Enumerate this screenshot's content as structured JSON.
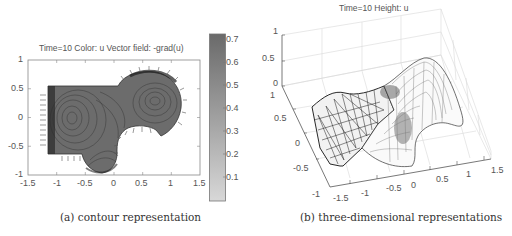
{
  "figure": {
    "panel_a": {
      "title": "Time=10   Color: u  Vector field: -grad(u)",
      "caption": "(a) contour representation",
      "xticks": [
        "-1.5",
        "-1",
        "-0.5",
        "0",
        "0.5",
        "1",
        "1.5"
      ],
      "yticks": [
        "1",
        "0.5",
        "0",
        "-0.5",
        "-1"
      ],
      "colorbar": {
        "ticks": [
          "0.7",
          "0.6",
          "0.5",
          "0.4",
          "0.3",
          "0.2",
          "0.1"
        ],
        "color_low": "#d6d6d6",
        "color_high": "#6a6a6a"
      }
    },
    "panel_b": {
      "title": "Time=10   Height: u",
      "caption": "(b) three-dimensional representations",
      "zticks": [
        "1",
        "0.5",
        "0"
      ],
      "yticks": [
        "1",
        "0.5",
        "0",
        "-0.5",
        "-1"
      ],
      "xticks": [
        "-1.5",
        "-1",
        "-0.5",
        "0",
        "0.5",
        "1",
        "1.5"
      ]
    }
  }
}
